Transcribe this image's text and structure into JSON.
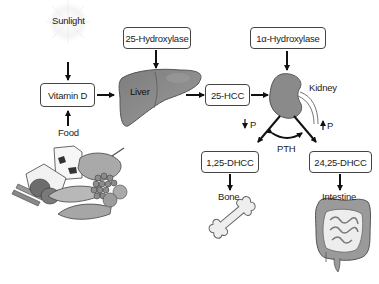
{
  "diagram": {
    "nodes": {
      "sunlight": "Sunlight",
      "food": "Food",
      "vitamin_d": "Vitamin D",
      "hydroxylase_25": "25-Hydroxylase",
      "liver": "Liver",
      "hcc_25": "25-HCC",
      "hydroxylase_1a": "1α-Hydroxylase",
      "kidney": "Kidney",
      "p_down": "P",
      "p_up": "P",
      "pth": "PTH",
      "dhcc_125": "1,25-DHCC",
      "dhcc_2425": "24,25-DHCC",
      "bone": "Bone",
      "intestine": "Intestine"
    },
    "edges": [
      {
        "from": "Sunlight",
        "to": "Vitamin D"
      },
      {
        "from": "Food",
        "to": "Vitamin D"
      },
      {
        "from": "Vitamin D",
        "to": "Liver"
      },
      {
        "from": "25-Hydroxylase",
        "to": "Liver"
      },
      {
        "from": "Liver",
        "to": "25-HCC"
      },
      {
        "from": "25-HCC",
        "to": "Kidney"
      },
      {
        "from": "1α-Hydroxylase",
        "to": "Kidney"
      },
      {
        "from": "Kidney",
        "to": "1,25-DHCC",
        "label": "↓P"
      },
      {
        "from": "Kidney",
        "to": "24,25-DHCC",
        "label": "↑P"
      },
      {
        "from": "1,25-DHCC",
        "to": "24,25-DHCC",
        "label": "PTH",
        "bidirectional": true
      },
      {
        "from": "1,25-DHCC",
        "to": "Bone"
      },
      {
        "from": "24,25-DHCC",
        "to": "Intestine"
      }
    ],
    "colors": {
      "organ_fill": "#8a8a8a",
      "organ_stroke": "#555555",
      "bone_fill": "#eeeeee",
      "arrow": "#111111",
      "box_border": "#444444"
    }
  }
}
